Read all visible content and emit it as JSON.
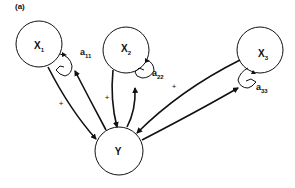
{
  "figure": {
    "panel_label": "(a)",
    "nodes": [
      {
        "id": "x1",
        "label": "X",
        "sub": "1"
      },
      {
        "id": "x2",
        "label": "X",
        "sub": "2"
      },
      {
        "id": "x3",
        "label": "X",
        "sub": "3"
      },
      {
        "id": "y",
        "label": "Y"
      }
    ],
    "self_loops": [
      {
        "node": "x1",
        "label": "a",
        "sub": "11"
      },
      {
        "node": "x2",
        "label": "a",
        "sub": "22"
      },
      {
        "node": "x3",
        "label": "a",
        "sub": "33"
      }
    ],
    "edges": [
      {
        "from": "x1",
        "to": "y",
        "sign": "+"
      },
      {
        "from": "y",
        "to": "x1"
      },
      {
        "from": "x2",
        "to": "y",
        "sign": "+"
      },
      {
        "from": "y",
        "to": "x2"
      },
      {
        "from": "x3",
        "to": "y",
        "sign": "+"
      },
      {
        "from": "y",
        "to": "x3"
      }
    ],
    "colors": {
      "stroke": "#111111",
      "background": "#ffffff"
    }
  }
}
